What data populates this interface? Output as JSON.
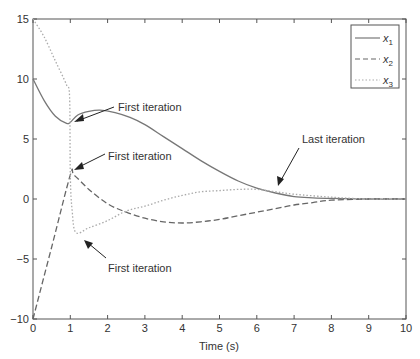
{
  "chart_data": {
    "type": "line",
    "title": "",
    "xlabel": "Time (s)",
    "ylabel": "",
    "xlim": [
      0,
      10
    ],
    "ylim": [
      -10,
      15
    ],
    "grid": false,
    "legend_position": "upper right",
    "x_ticks": [
      "0",
      "1",
      "2",
      "3",
      "4",
      "5",
      "6",
      "7",
      "8",
      "9",
      "10"
    ],
    "y_ticks": [
      "15",
      "10",
      "5",
      "0",
      "-5",
      "-10"
    ],
    "series": [
      {
        "name": "x1",
        "style": "solid",
        "x": [
          0,
          0.3,
          0.6,
          0.9,
          1.0,
          1.2,
          1.5,
          1.8,
          2.2,
          2.6,
          3.0,
          3.5,
          4.0,
          4.5,
          5.0,
          5.5,
          6.0,
          6.5,
          7.0,
          7.5,
          8.0,
          9.0,
          10.0
        ],
        "values": [
          10,
          8.2,
          6.9,
          6.3,
          6.4,
          7.0,
          7.3,
          7.4,
          7.2,
          6.8,
          6.2,
          5.2,
          4.2,
          3.2,
          2.3,
          1.5,
          0.9,
          0.5,
          0.2,
          0.1,
          0.05,
          0.0,
          0.0
        ]
      },
      {
        "name": "x2",
        "style": "dashed",
        "x": [
          0,
          0.5,
          1.0,
          1.1,
          1.5,
          2.0,
          2.5,
          3.0,
          3.5,
          4.0,
          4.5,
          5.0,
          5.5,
          6.0,
          6.5,
          7.0,
          7.5,
          8.0,
          9.0,
          10.0
        ],
        "values": [
          -10,
          -4,
          2,
          2.0,
          0.8,
          -0.4,
          -1.1,
          -1.6,
          -1.9,
          -2.0,
          -1.9,
          -1.7,
          -1.4,
          -1.1,
          -0.8,
          -0.5,
          -0.3,
          -0.1,
          0.0,
          0.0
        ]
      },
      {
        "name": "x3",
        "style": "dotted",
        "x": [
          0,
          0.3,
          0.6,
          0.9,
          0.98,
          1.0,
          1.05,
          1.15,
          1.5,
          2.0,
          2.5,
          3.0,
          3.5,
          4.0,
          4.5,
          5.0,
          5.5,
          6.0,
          6.5,
          7.0,
          8.0,
          9.0,
          10.0
        ],
        "values": [
          15,
          13.5,
          11.5,
          9.5,
          8.5,
          2,
          -1,
          -2.8,
          -2.4,
          -1.8,
          -1.0,
          -0.6,
          -0.1,
          0.3,
          0.6,
          0.7,
          0.8,
          0.8,
          0.6,
          0.4,
          0.15,
          0.0,
          0.0
        ]
      }
    ],
    "legend": [
      "x1",
      "x2",
      "x3"
    ],
    "annotations": [
      {
        "text": "First iteration",
        "target_x": 1.0,
        "target_y": 8.5,
        "label_pos": "right"
      },
      {
        "text": "First iteration",
        "target_x": 1.0,
        "target_y": 2.0,
        "label_pos": "right"
      },
      {
        "text": "First iteration",
        "target_x": 1.2,
        "target_y": -3.0,
        "label_pos": "below-right"
      },
      {
        "text": "Last iteration",
        "target_x": 6.7,
        "target_y": 0.6,
        "label_pos": "above"
      }
    ]
  },
  "labels": {
    "xlabel": "Time (s)",
    "legend_x1": "x",
    "legend_x2": "x",
    "legend_x3": "x",
    "legend_sub1": "1",
    "legend_sub2": "2",
    "legend_sub3": "3",
    "ann1": "First iteration",
    "ann2": "First iteration",
    "ann3": "First iteration",
    "ann4": "Last iteration"
  },
  "colors": {
    "axis": "#444444",
    "x1": "#777777",
    "x2": "#666666",
    "x3": "#aaaaaa",
    "text": "#333333"
  }
}
